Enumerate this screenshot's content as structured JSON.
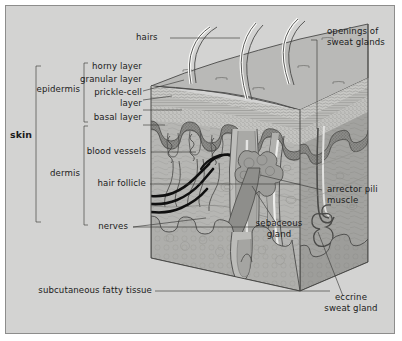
{
  "figure": {
    "background_color": "#d3d3d2",
    "border_color": "#8d8d8c",
    "ink_color": "#1b1b1b"
  },
  "labels": {
    "skin": "skin",
    "epidermis": "epidermis",
    "dermis": "dermis",
    "horny_layer": "horny layer",
    "granular_layer": "granular layer",
    "prickle_cell_layer_1": "prickle-cell",
    "prickle_cell_layer_2": "layer",
    "basal_layer": "basal layer",
    "blood_vessels": "blood vessels",
    "hair_follicle": "hair follicle",
    "nerves": "nerves",
    "subcutaneous_fatty_tissue": "subcutaneous fatty tissue",
    "hairs": "hairs",
    "openings_of_sweat_glands_1": "openings of",
    "openings_of_sweat_glands_2": "sweat glands",
    "arrector_pili_muscle_1": "arrector pili",
    "arrector_pili_muscle_2": "muscle",
    "sebaceous_gland_1": "sebaceous",
    "sebaceous_gland_2": "gland",
    "eccrine_sweat_gland_1": "eccrine",
    "eccrine_sweat_gland_2": "sweat gland"
  },
  "colors": {
    "skin_top_surface": "#b9b9b7",
    "horny_layer": "#c9c9c6",
    "granular_layer": "#bdbdba",
    "prickle_cell_layer": "#c2c2bf",
    "basal_layer": "#8f8f8c",
    "dermis": "#b5b5b2",
    "dermis_right_face": "#9e9e9b",
    "subcutaneous_fat": "#adadaa",
    "sebaceous_gland": "#9a9a97",
    "hair_shaft": "#e8e8e6",
    "nerve": "#101010",
    "outline": "#4a4a48"
  }
}
